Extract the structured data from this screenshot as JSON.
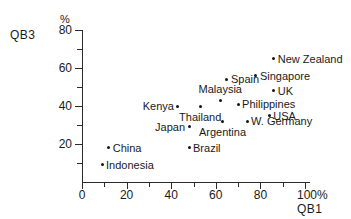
{
  "chart_data": {
    "type": "scatter",
    "title": "",
    "xlabel": "QB1",
    "ylabel": "QB3",
    "x_unit": "%",
    "y_unit": "%",
    "xlim": [
      0,
      100
    ],
    "ylim": [
      0,
      80
    ],
    "grid": false,
    "legend": "none",
    "x_ticks": [
      0,
      20,
      40,
      60,
      80,
      100
    ],
    "x_tick_labels": [
      "0",
      "20",
      "40",
      "60",
      "80",
      "100%"
    ],
    "x_minor_ticks": [
      10,
      30,
      50,
      70,
      90
    ],
    "y_ticks": [
      20,
      40,
      60,
      80
    ],
    "y_tick_labels": [
      "20",
      "40",
      "60",
      "80"
    ],
    "y_minor_ticks": [
      10,
      30,
      50,
      70
    ],
    "points": [
      {
        "name": "New Zealand",
        "x": 86,
        "y": 65,
        "label_side": "right"
      },
      {
        "name": "Singapore",
        "x": 78,
        "y": 56,
        "label_side": "right"
      },
      {
        "name": "Spain",
        "x": 65,
        "y": 54,
        "label_side": "right"
      },
      {
        "name": "UK",
        "x": 86,
        "y": 48,
        "label_side": "right"
      },
      {
        "name": "Malaysia",
        "x": 62,
        "y": 43,
        "label_side": "above"
      },
      {
        "name": "Philippines",
        "x": 70,
        "y": 41,
        "label_side": "right"
      },
      {
        "name": "Kenya",
        "x": 43,
        "y": 40,
        "label_side": "left"
      },
      {
        "name": "Thailand",
        "x": 53,
        "y": 40,
        "label_side": "below"
      },
      {
        "name": "USA",
        "x": 84,
        "y": 35,
        "label_side": "right"
      },
      {
        "name": "W. Germany",
        "x": 74,
        "y": 32,
        "label_side": "right"
      },
      {
        "name": "Argentina",
        "x": 63,
        "y": 32,
        "label_side": "below"
      },
      {
        "name": "Japan",
        "x": 48,
        "y": 29,
        "label_side": "left"
      },
      {
        "name": "Brazil",
        "x": 48,
        "y": 18,
        "label_side": "right"
      },
      {
        "name": "China",
        "x": 12,
        "y": 18,
        "label_side": "right"
      },
      {
        "name": "Indonesia",
        "x": 9,
        "y": 9,
        "label_side": "right"
      }
    ]
  },
  "axes": {
    "y_title": "QB3",
    "y_unit_symbol": "%",
    "x_title": "QB1"
  },
  "colors": {
    "background": "#ffffff",
    "axis": "#2b2b2b",
    "point": "#141414",
    "text": "#1a1a1a"
  }
}
